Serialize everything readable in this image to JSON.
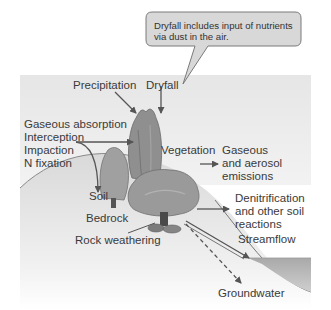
{
  "callout": {
    "text_line1": "Dryfall includes input of nutrients",
    "text_line2": "via dust in the air."
  },
  "labels": {
    "precipitation": "Precipitation",
    "dryfall": "Dryfall",
    "gaseous_absorption": "Gaseous absorption",
    "interception": "Interception",
    "impaction": "Impaction",
    "n_fixation": "N fixation",
    "vegetation": "Vegetation",
    "gaseous_line1": "Gaseous",
    "gaseous_line2": "and aerosol",
    "gaseous_line3": "emissions",
    "soil": "Soil",
    "bedrock": "Bedrock",
    "rock_weathering": "Rock weathering",
    "denit_line1": "Denitrification",
    "denit_line2": "and other soil",
    "denit_line3": "reactions",
    "streamflow": "Streamflow",
    "groundwater": "Groundwater"
  },
  "colors": {
    "sky": "#ececec",
    "ground": "#e4e4e4",
    "stream": "#b9b9b9",
    "arrow": "#555555",
    "callout_fill": "#d6d6d6",
    "callout_stroke": "#7a7a7a"
  }
}
